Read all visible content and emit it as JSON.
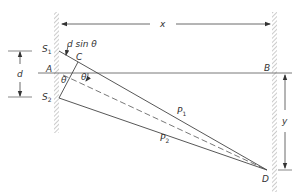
{
  "diagram": {
    "type": "double-slit interference geometry",
    "colors": {
      "line": "#444444",
      "hatch": "#9a9a9a",
      "text": "#333333"
    },
    "labels": {
      "x": "x",
      "d": "d",
      "y": "y",
      "d_sin_theta": "d sin θ",
      "theta_left": "θ",
      "theta_right": "θ",
      "A": "A",
      "B": "B",
      "C": "C",
      "D": "D",
      "S1": "S",
      "S1_sub": "1",
      "S2": "S",
      "S2_sub": "2",
      "P1": "P",
      "P1_sub": "1",
      "P2": "P",
      "P2_sub": "2"
    }
  }
}
